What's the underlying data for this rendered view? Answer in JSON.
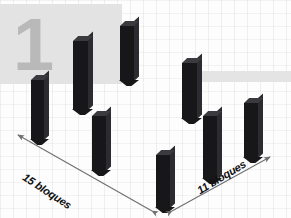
{
  "figure": {
    "kind": "isometric-3d-bar-diagram",
    "watermark": {
      "digit": "1",
      "panel_color": "#e3e3e3",
      "digit_color": "#b9b9b9"
    },
    "background_color": "#fdfdfd",
    "bar_color": "#17171a",
    "bar_top_color": "#3a3a3f",
    "bar_side_color": "#2c2c30",
    "axis_color": "#6f6f6f"
  },
  "axes": [
    {
      "id": "left",
      "label": "15 bloques",
      "count": 15,
      "unit": "bloques",
      "arrow_start_px": [
        17,
        134
      ],
      "arrow_end_px": [
        152,
        211
      ]
    },
    {
      "id": "right",
      "label": "11 bloques",
      "count": 11,
      "unit": "bloques",
      "arrow_start_px": [
        172,
        211
      ],
      "arrow_end_px": [
        271,
        156
      ]
    }
  ],
  "chart_data": {
    "type": "bar",
    "title": "",
    "xlabel": "15 bloques",
    "ylabel": "11 bloques",
    "categories": [
      "b1",
      "b2",
      "b3",
      "b4",
      "b5",
      "b6",
      "b7",
      "b8"
    ],
    "values": [
      60,
      70,
      56,
      56,
      53,
      57,
      64,
      56
    ]
  },
  "bars": [
    {
      "name": "bar-1",
      "left": 31,
      "top": 80,
      "width": 13,
      "height": 60
    },
    {
      "name": "bar-2",
      "left": 73,
      "top": 41,
      "width": 15,
      "height": 69
    },
    {
      "name": "bar-3",
      "left": 120,
      "top": 26,
      "width": 14,
      "height": 55
    },
    {
      "name": "bar-4",
      "left": 92,
      "top": 116,
      "width": 14,
      "height": 55
    },
    {
      "name": "bar-5",
      "left": 156,
      "top": 155,
      "width": 14,
      "height": 53
    },
    {
      "name": "bar-6",
      "left": 182,
      "top": 63,
      "width": 15,
      "height": 56
    },
    {
      "name": "bar-7",
      "left": 203,
      "top": 116,
      "width": 14,
      "height": 63
    },
    {
      "name": "bar-8",
      "left": 244,
      "top": 103,
      "width": 14,
      "height": 55
    }
  ]
}
